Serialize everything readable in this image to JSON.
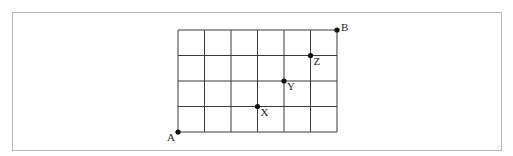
{
  "diagram": {
    "type": "grid",
    "columns": 6,
    "rows": 4,
    "origin_px": {
      "x": 178,
      "y": 132
    },
    "cell_px": {
      "w": 26.5,
      "h": 25.5
    },
    "line_color": "#3a3a3a",
    "point_color": "#111111",
    "frame_color": "#b8b8b8",
    "points": [
      {
        "name": "A",
        "col": 0,
        "row": 0,
        "label_dx": -11,
        "label_dy": 9
      },
      {
        "name": "B",
        "col": 6,
        "row": 4,
        "label_dx": 4,
        "label_dy": 1
      },
      {
        "name": "X",
        "col": 3,
        "row": 1,
        "label_dx": 3,
        "label_dy": 9
      },
      {
        "name": "Y",
        "col": 4,
        "row": 2,
        "label_dx": 3,
        "label_dy": 9
      },
      {
        "name": "Z",
        "col": 5,
        "row": 3,
        "label_dx": 3,
        "label_dy": 9
      }
    ]
  }
}
